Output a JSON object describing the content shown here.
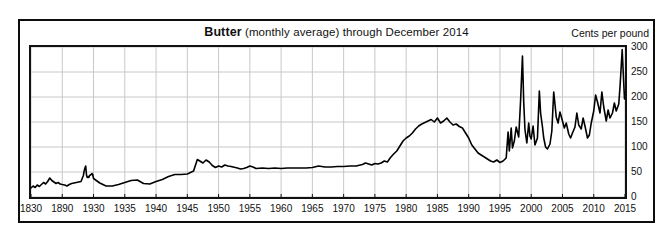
{
  "chart_data": {
    "type": "line",
    "title": "Butter (monthly average) through December 2014",
    "title_series": "Butter",
    "title_rest": " (monthly average) through December 2014",
    "unit_label": "Cents per pound",
    "xlabel": "",
    "ylabel": "Cents per pound",
    "ylim": [
      0,
      300
    ],
    "y_ticks": [
      0,
      50,
      100,
      150,
      200,
      250,
      300
    ],
    "y_tick_labels": [
      "0",
      "50",
      "100",
      "150",
      "200",
      "250",
      "300"
    ],
    "x_tick_labels": [
      "1830",
      "1890",
      "1930",
      "1935",
      "1940",
      "1945",
      "1950",
      "1955",
      "1960",
      "1965",
      "1970",
      "1975",
      "1980",
      "1985",
      "1990",
      "1995",
      "2000",
      "2005",
      "2010",
      "2015"
    ],
    "x_tick_values": [
      1830,
      1890,
      1930,
      1935,
      1940,
      1945,
      1950,
      1955,
      1960,
      1965,
      1970,
      1975,
      1980,
      1985,
      1990,
      1995,
      2000,
      2005,
      2010,
      2015
    ],
    "x_axis_note": "compressed non-linear axis: 1830-1890 and 1890-1930 each occupy one tick interval, then uniform 5-year intervals",
    "grid": true,
    "grid_color": "#c8c8c8",
    "line_color": "#000000",
    "legend": "none",
    "series": [
      {
        "name": "Butter",
        "points": [
          [
            1830,
            18
          ],
          [
            1834,
            22
          ],
          [
            1838,
            19
          ],
          [
            1842,
            24
          ],
          [
            1846,
            21
          ],
          [
            1850,
            25
          ],
          [
            1854,
            29
          ],
          [
            1858,
            26
          ],
          [
            1862,
            31
          ],
          [
            1866,
            38
          ],
          [
            1870,
            33
          ],
          [
            1874,
            30
          ],
          [
            1878,
            27
          ],
          [
            1882,
            29
          ],
          [
            1886,
            26
          ],
          [
            1890,
            25
          ],
          [
            1893,
            24
          ],
          [
            1896,
            22
          ],
          [
            1899,
            25
          ],
          [
            1902,
            27
          ],
          [
            1905,
            28
          ],
          [
            1908,
            29
          ],
          [
            1911,
            30
          ],
          [
            1914,
            31
          ],
          [
            1917,
            43
          ],
          [
            1918,
            52
          ],
          [
            1919,
            58
          ],
          [
            1920,
            62
          ],
          [
            1921,
            44
          ],
          [
            1922,
            39
          ],
          [
            1923,
            41
          ],
          [
            1924,
            39
          ],
          [
            1925,
            43
          ],
          [
            1926,
            44
          ],
          [
            1927,
            45
          ],
          [
            1928,
            47
          ],
          [
            1929,
            45
          ],
          [
            1930,
            37
          ],
          [
            1931,
            28
          ],
          [
            1932,
            22
          ],
          [
            1933,
            22
          ],
          [
            1934,
            25
          ],
          [
            1935,
            29
          ],
          [
            1936,
            33
          ],
          [
            1937,
            34
          ],
          [
            1938,
            27
          ],
          [
            1939,
            26
          ],
          [
            1940,
            31
          ],
          [
            1941,
            35
          ],
          [
            1942,
            41
          ],
          [
            1943,
            45
          ],
          [
            1944,
            45
          ],
          [
            1945,
            46
          ],
          [
            1946,
            52
          ],
          [
            1946.6,
            75
          ],
          [
            1947,
            72
          ],
          [
            1947.5,
            68
          ],
          [
            1948,
            74
          ],
          [
            1948.5,
            70
          ],
          [
            1949,
            63
          ],
          [
            1949.5,
            59
          ],
          [
            1950,
            62
          ],
          [
            1950.5,
            60
          ],
          [
            1951,
            64
          ],
          [
            1951.5,
            62
          ],
          [
            1952,
            61
          ],
          [
            1953,
            58
          ],
          [
            1953.5,
            56
          ],
          [
            1954,
            57
          ],
          [
            1954.5,
            59
          ],
          [
            1955,
            62
          ],
          [
            1955.5,
            60
          ],
          [
            1956,
            57
          ],
          [
            1957,
            58
          ],
          [
            1958,
            57
          ],
          [
            1959,
            58
          ],
          [
            1960,
            57
          ],
          [
            1961,
            58
          ],
          [
            1962,
            58
          ],
          [
            1963,
            58
          ],
          [
            1964,
            58
          ],
          [
            1965,
            59
          ],
          [
            1966,
            62
          ],
          [
            1967,
            60
          ],
          [
            1968,
            60
          ],
          [
            1969,
            61
          ],
          [
            1970,
            61
          ],
          [
            1971,
            62
          ],
          [
            1972,
            62
          ],
          [
            1973,
            65
          ],
          [
            1973.5,
            68
          ],
          [
            1974,
            66
          ],
          [
            1974.5,
            64
          ],
          [
            1975,
            67
          ],
          [
            1975.5,
            66
          ],
          [
            1976,
            68
          ],
          [
            1976.5,
            72
          ],
          [
            1977,
            70
          ],
          [
            1977.5,
            79
          ],
          [
            1978,
            86
          ],
          [
            1978.5,
            92
          ],
          [
            1979,
            102
          ],
          [
            1979.5,
            112
          ],
          [
            1980,
            118
          ],
          [
            1980.5,
            122
          ],
          [
            1981,
            128
          ],
          [
            1981.5,
            136
          ],
          [
            1982,
            142
          ],
          [
            1982.5,
            146
          ],
          [
            1983,
            149
          ],
          [
            1983.5,
            152
          ],
          [
            1984,
            155
          ],
          [
            1984.5,
            150
          ],
          [
            1985,
            158
          ],
          [
            1985.5,
            148
          ],
          [
            1986,
            152
          ],
          [
            1986.5,
            158
          ],
          [
            1987,
            150
          ],
          [
            1987.5,
            144
          ],
          [
            1988,
            146
          ],
          [
            1988.5,
            141
          ],
          [
            1989,
            138
          ],
          [
            1989.5,
            128
          ],
          [
            1990,
            118
          ],
          [
            1990.5,
            104
          ],
          [
            1991,
            96
          ],
          [
            1991.5,
            88
          ],
          [
            1992,
            84
          ],
          [
            1992.5,
            80
          ],
          [
            1993,
            76
          ],
          [
            1993.5,
            72
          ],
          [
            1994,
            70
          ],
          [
            1994.5,
            74
          ],
          [
            1995,
            69
          ],
          [
            1995.5,
            72
          ],
          [
            1996,
            78
          ],
          [
            1996.3,
            130
          ],
          [
            1996.5,
            92
          ],
          [
            1996.8,
            138
          ],
          [
            1997,
            98
          ],
          [
            1997.3,
            112
          ],
          [
            1997.6,
            140
          ],
          [
            1998,
            120
          ],
          [
            1998.3,
            192
          ],
          [
            1998.6,
            282
          ],
          [
            1998.8,
            190
          ],
          [
            1999,
            135
          ],
          [
            1999.3,
            108
          ],
          [
            1999.6,
            148
          ],
          [
            1999.8,
            122
          ],
          [
            2000,
            116
          ],
          [
            2000.3,
            142
          ],
          [
            2000.6,
            104
          ],
          [
            2001,
            118
          ],
          [
            2001.3,
            212
          ],
          [
            2001.5,
            168
          ],
          [
            2001.8,
            140
          ],
          [
            2002,
            118
          ],
          [
            2002.3,
            100
          ],
          [
            2002.6,
            96
          ],
          [
            2003,
            106
          ],
          [
            2003.3,
            132
          ],
          [
            2003.6,
            210
          ],
          [
            2003.8,
            186
          ],
          [
            2004,
            160
          ],
          [
            2004.3,
            148
          ],
          [
            2004.6,
            170
          ],
          [
            2005,
            152
          ],
          [
            2005.3,
            138
          ],
          [
            2005.6,
            148
          ],
          [
            2006,
            126
          ],
          [
            2006.3,
            118
          ],
          [
            2006.6,
            128
          ],
          [
            2007,
            140
          ],
          [
            2007.3,
            168
          ],
          [
            2007.6,
            144
          ],
          [
            2008,
            136
          ],
          [
            2008.3,
            158
          ],
          [
            2008.6,
            142
          ],
          [
            2009,
            118
          ],
          [
            2009.3,
            124
          ],
          [
            2009.6,
            148
          ],
          [
            2010,
            172
          ],
          [
            2010.3,
            204
          ],
          [
            2010.6,
            190
          ],
          [
            2011,
            168
          ],
          [
            2011.3,
            210
          ],
          [
            2011.6,
            180
          ],
          [
            2012,
            152
          ],
          [
            2012.3,
            174
          ],
          [
            2012.6,
            158
          ],
          [
            2013,
            168
          ],
          [
            2013.3,
            188
          ],
          [
            2013.6,
            172
          ],
          [
            2014,
            186
          ],
          [
            2014.2,
            220
          ],
          [
            2014.4,
            262
          ],
          [
            2014.55,
            295
          ],
          [
            2014.75,
            240
          ],
          [
            2014.92,
            196
          ]
        ]
      }
    ]
  }
}
